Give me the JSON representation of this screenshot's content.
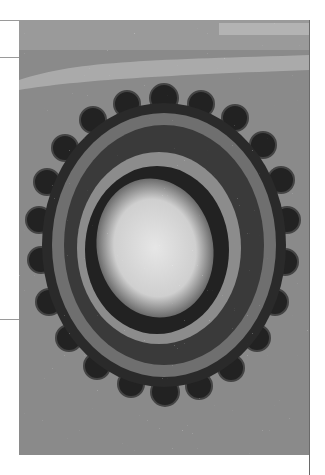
{
  "image": {
    "subject": "electron micrograph of a spherical virus particle with surface spikes",
    "palette": {
      "background": "#8a8a8a",
      "dark": "#1a1a1a",
      "light": "#e8e8e8",
      "mid": "#5a5a5a"
    }
  }
}
